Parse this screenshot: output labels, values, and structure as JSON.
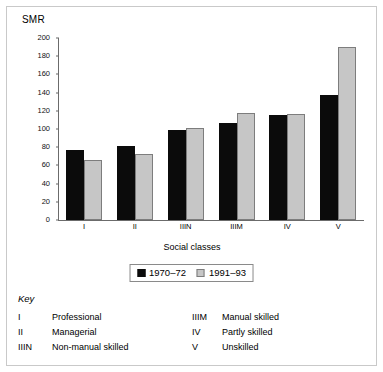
{
  "chart_data": {
    "type": "bar",
    "title": "",
    "xlabel": "Social classes",
    "ylabel": "SMR",
    "categories": [
      "I",
      "II",
      "IIIN",
      "IIIM",
      "IV",
      "V"
    ],
    "series": [
      {
        "name": "1970–72",
        "color": "#0b0b0b",
        "values": [
          77,
          81,
          99,
          107,
          115,
          137
        ]
      },
      {
        "name": "1991–93",
        "color": "#c6c6c6",
        "values": [
          66,
          72,
          101,
          118,
          117,
          190
        ]
      }
    ],
    "ylim": [
      0,
      200
    ],
    "yticks": [
      0,
      20,
      40,
      60,
      80,
      100,
      120,
      140,
      160,
      180,
      200
    ],
    "ytick_labels": [
      "0",
      "20",
      "40",
      "60",
      "80",
      "100",
      "120",
      "140",
      "160",
      "180",
      "200"
    ],
    "grid": false,
    "legend_position": "bottom"
  },
  "axis": {
    "y_label": "SMR",
    "x_title": "Social classes"
  },
  "legend": {
    "items": [
      {
        "label": "1970–72",
        "swatch": "dark-square-icon"
      },
      {
        "label": "1991–93",
        "swatch": "light-square-icon"
      }
    ]
  },
  "key": {
    "title": "Key",
    "left": [
      {
        "code": "I",
        "text": "Professional"
      },
      {
        "code": "II",
        "text": "Managerial"
      },
      {
        "code": "IIIN",
        "text": "Non-manual skilled"
      }
    ],
    "right": [
      {
        "code": "IIIM",
        "text": "Manual skilled"
      },
      {
        "code": "IV",
        "text": "Partly skilled"
      },
      {
        "code": "V",
        "text": "Unskilled"
      }
    ]
  },
  "colors": {
    "series_1970": "#0b0b0b",
    "series_1991": "#c6c6c6",
    "axis": "#6b6b6b",
    "frame": "#c9c9c9"
  }
}
